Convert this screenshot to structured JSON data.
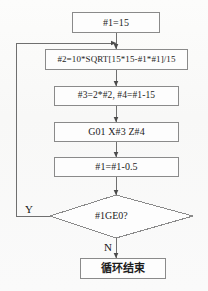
{
  "diagram": {
    "type": "flowchart",
    "colors": {
      "stroke": "#8a8a8a",
      "line": "#6f6f6f",
      "text": "#1c1c1c",
      "background": "#fbfbfa"
    },
    "nodes": [
      {
        "id": "init",
        "shape": "process",
        "text": "#1=15"
      },
      {
        "id": "calc2",
        "shape": "process",
        "text": "#2=10*SQRT[15*15-#1*#1]/15"
      },
      {
        "id": "calc34",
        "shape": "process",
        "text": "#3=2*#2,  #4=#1-15"
      },
      {
        "id": "move",
        "shape": "process",
        "text": "G01 X#3 Z#4"
      },
      {
        "id": "decr",
        "shape": "process",
        "text": "#1=#1-0.5"
      },
      {
        "id": "test",
        "shape": "decision",
        "text": "#1GE0?"
      },
      {
        "id": "end",
        "shape": "process",
        "text": "循环结束"
      }
    ],
    "edge_labels": {
      "yes": "Y",
      "no": "N"
    },
    "edges": [
      {
        "from": "init",
        "to": "calc2",
        "label": ""
      },
      {
        "from": "calc2",
        "to": "calc34",
        "label": ""
      },
      {
        "from": "calc34",
        "to": "move",
        "label": ""
      },
      {
        "from": "move",
        "to": "decr",
        "label": ""
      },
      {
        "from": "decr",
        "to": "test",
        "label": ""
      },
      {
        "from": "test",
        "to": "calc2",
        "label": "Y"
      },
      {
        "from": "test",
        "to": "end",
        "label": "N"
      }
    ]
  }
}
